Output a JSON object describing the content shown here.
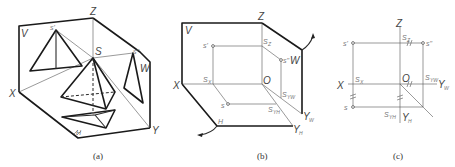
{
  "figure": {
    "panels": [
      {
        "id": "a",
        "caption": "(a)",
        "labels": {
          "plane_v": "V",
          "plane_w": "W",
          "plane_h": "H",
          "axis_x": "X",
          "axis_y": "Y",
          "axis_z": "Z",
          "apex_space": "S",
          "apex_front": "s'",
          "apex_side": "s''",
          "apex_top": "s"
        }
      },
      {
        "id": "b",
        "caption": "(b)",
        "labels": {
          "plane_v": "V",
          "plane_w": "W",
          "plane_h": "H",
          "axis_x": "X",
          "axis_z": "Z",
          "axis_yw": "Y",
          "axis_yw_sub": "W",
          "axis_yh": "Y",
          "axis_yh_sub": "H",
          "origin": "O",
          "pt_front": "s'",
          "pt_side": "s''",
          "pt_top": "s",
          "sx": "S",
          "sx_sub": "X",
          "sz": "S",
          "sz_sub": "Z",
          "syw": "S",
          "syw_sub": "YW",
          "syh": "S",
          "syh_sub": "YH"
        }
      },
      {
        "id": "c",
        "caption": "(c)",
        "labels": {
          "axis_x": "X",
          "axis_z": "Z",
          "axis_yw": "Y",
          "axis_yw_sub": "W",
          "axis_yh": "Y",
          "axis_yh_sub": "H",
          "origin": "O",
          "pt_front": "s'",
          "pt_side": "s''",
          "pt_top": "s",
          "sx": "S",
          "sx_sub": "X",
          "sz": "S",
          "sz_sub": "Z",
          "syw": "S",
          "syw_sub": "YW",
          "syh": "S",
          "syh_sub": "YH"
        }
      }
    ]
  }
}
